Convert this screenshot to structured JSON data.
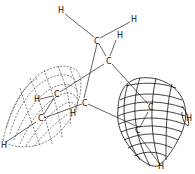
{
  "figure": {
    "type": "molecular-orbital-diagram",
    "lobes": [
      {
        "name": "left-lobe",
        "style": "dashed"
      },
      {
        "name": "right-lobe",
        "style": "solid"
      }
    ],
    "atoms": [
      {
        "id": "h1",
        "label": "H",
        "x": 60,
        "y": 11
      },
      {
        "id": "h2",
        "label": "H",
        "x": 132,
        "y": 21
      },
      {
        "id": "c1",
        "label": "C",
        "x": 95,
        "y": 42
      },
      {
        "id": "h3",
        "label": "H",
        "x": 117,
        "y": 36
      },
      {
        "id": "c2",
        "label": "C",
        "x": 107,
        "y": 62
      },
      {
        "id": "c3",
        "label": "C",
        "x": 55,
        "y": 95
      },
      {
        "id": "h4",
        "label": "H",
        "x": 35,
        "y": 100
      },
      {
        "id": "c4",
        "label": "C",
        "x": 83,
        "y": 104
      },
      {
        "id": "h5",
        "label": "H",
        "x": 70,
        "y": 114
      },
      {
        "id": "c5",
        "label": "C",
        "x": 39,
        "y": 119
      },
      {
        "id": "h6",
        "label": "H",
        "x": 2,
        "y": 146
      },
      {
        "id": "c6",
        "label": "C",
        "x": 149,
        "y": 108
      },
      {
        "id": "h7",
        "label": "H",
        "x": 186,
        "y": 119
      },
      {
        "id": "c7",
        "label": "C",
        "x": 136,
        "y": 131
      },
      {
        "id": "h8",
        "label": "H",
        "x": 159,
        "y": 167
      }
    ]
  }
}
